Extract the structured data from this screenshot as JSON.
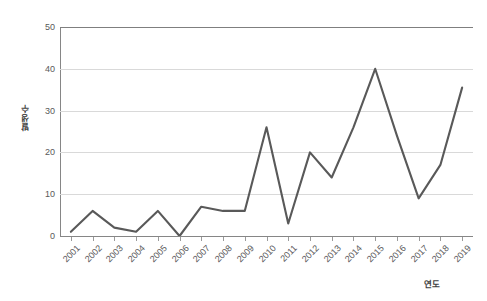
{
  "chart_data": {
    "type": "line",
    "title": "",
    "subtitle": "",
    "xlabel": "연도",
    "ylabel": "발생수",
    "categories": [
      "2001",
      "2002",
      "2003",
      "2004",
      "2005",
      "2006",
      "2007",
      "2008",
      "2009",
      "2010",
      "2011",
      "2012",
      "2013",
      "2014",
      "2015",
      "2016",
      "2017",
      "2018",
      "2019"
    ],
    "values": [
      1,
      6,
      2,
      1,
      6,
      0,
      7,
      6,
      6,
      26,
      3,
      20,
      14,
      26,
      40,
      24,
      9,
      17,
      35.5
    ],
    "series": [
      {
        "name": "발생수",
        "values": [
          1,
          6,
          2,
          1,
          6,
          0,
          7,
          6,
          6,
          26,
          3,
          20,
          14,
          26,
          40,
          24,
          9,
          17,
          35.5
        ]
      }
    ],
    "ylim": [
      0,
      50
    ],
    "y_ticks": [
      0,
      10,
      20,
      30,
      40,
      50
    ],
    "grid": true,
    "legend": "none",
    "line_color": "#595959",
    "gridline_color": "#d9d9d9",
    "axis_color": "#868686",
    "plot_background": "#ffffff"
  },
  "axes": {
    "y_title": "발생수",
    "x_title": "연도",
    "y_tick_labels": [
      "50",
      "40",
      "30",
      "20",
      "10",
      "0"
    ],
    "x_tick_labels": [
      "2001",
      "2002",
      "2003",
      "2004",
      "2005",
      "2006",
      "2007",
      "2008",
      "2009",
      "2010",
      "2011",
      "2012",
      "2013",
      "2014",
      "2015",
      "2016",
      "2017",
      "2018",
      "2019"
    ]
  }
}
